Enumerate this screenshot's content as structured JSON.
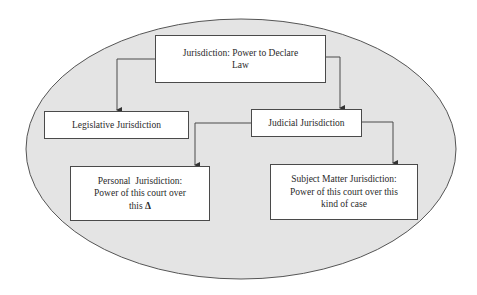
{
  "diagram": {
    "container": {
      "shape": "ellipse",
      "fill": "#e4e4e4",
      "stroke": "#555555"
    },
    "nodes": {
      "root": {
        "lines": [
          "Jurisdiction: Power to Declare",
          "Law"
        ]
      },
      "legislative": {
        "lines": [
          "Legislative Jurisdiction"
        ]
      },
      "judicial": {
        "lines": [
          "Judicial Jurisdiction"
        ]
      },
      "personal": {
        "lines": [
          "Personal  Jurisdiction:",
          "Power of this court over",
          "this"
        ],
        "symbol": "Δ"
      },
      "subject_matter": {
        "lines": [
          "Subject Matter Jurisdiction:",
          "Power of this court over this",
          "kind of case"
        ]
      }
    },
    "edges": [
      {
        "from": "root",
        "to": "legislative"
      },
      {
        "from": "root",
        "to": "judicial"
      },
      {
        "from": "judicial",
        "to": "personal"
      },
      {
        "from": "judicial",
        "to": "subject_matter"
      }
    ],
    "colors": {
      "line": "#4a4a4a",
      "box_fill": "#ffffff",
      "text": "#2a2a2a"
    }
  }
}
